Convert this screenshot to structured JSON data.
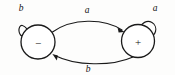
{
  "diagram": {
    "background_color": "#fdfdfc",
    "stroke_color": "#1a1a1a",
    "nodes": [
      {
        "id": "minus",
        "label": "−",
        "name": "state-node-minus",
        "cx": 38,
        "cy": 42,
        "r": 17
      },
      {
        "id": "plus",
        "label": "+",
        "name": "state-node-plus",
        "cx": 138,
        "cy": 41,
        "r": 16.5
      }
    ],
    "edges": [
      {
        "id": "minus-to-plus",
        "label": "a",
        "name": "transition-minus-to-plus",
        "from": "minus",
        "to": "plus",
        "label_x": 87,
        "label_y": 13
      },
      {
        "id": "plus-to-minus",
        "label": "b",
        "name": "transition-plus-to-minus",
        "from": "plus",
        "to": "minus",
        "label_x": 88,
        "label_y": 72
      }
    ],
    "self_loops": [
      {
        "id": "minus-loop",
        "label": "b",
        "name": "self-loop-minus",
        "on": "minus",
        "label_x": 21,
        "label_y": 11
      },
      {
        "id": "plus-loop",
        "label": "a",
        "name": "self-loop-plus",
        "on": "plus",
        "label_x": 155,
        "label_y": 11
      }
    ]
  }
}
